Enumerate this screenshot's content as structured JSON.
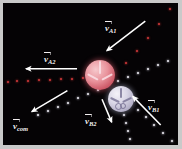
{
  "figure": {
    "kind": "physics-collision-diagram",
    "background_color": "#050305",
    "frame_color": "#c9c9c9",
    "width": 182,
    "height": 149
  },
  "labels": {
    "v_a1": {
      "symbol": "v",
      "subscript": "A1",
      "text": "v⃗A1",
      "x": 105,
      "y": 24
    },
    "v_a2": {
      "symbol": "v",
      "subscript": "A2",
      "text": "v⃗A2",
      "x": 44,
      "y": 55
    },
    "v_com": {
      "symbol": "v",
      "subscript": "com",
      "text": "v⃗com",
      "x": 13,
      "y": 122
    },
    "v_b2": {
      "symbol": "v",
      "subscript": "B2",
      "text": "v⃗B2",
      "x": 85,
      "y": 117
    },
    "v_b1": {
      "symbol": "v",
      "subscript": "B1",
      "text": "v⃗B1",
      "x": 148,
      "y": 103
    }
  },
  "balls": {
    "ball_a": {
      "name": "ball-A",
      "color": "#e0848f",
      "cx": 100,
      "cy": 75,
      "r": 15
    },
    "ball_b": {
      "name": "ball-B",
      "color": "#cdcadd",
      "cx": 121,
      "cy": 99,
      "r": 13
    }
  },
  "arrows": {
    "v_a1": {
      "x1": 151,
      "y1": 22,
      "x2": 111,
      "y2": 53,
      "color": "#ffffff"
    },
    "v_a2": {
      "x1": 80,
      "y1": 72,
      "x2": 27,
      "y2": 72,
      "color": "#ffffff"
    },
    "v_com": {
      "x1": 70,
      "y1": 95,
      "x2": 33,
      "y2": 117,
      "color": "#ffffff"
    },
    "v_b2": {
      "x1": 106,
      "y1": 104,
      "x2": 116,
      "y2": 128,
      "color": "#ffffff"
    },
    "v_b1": {
      "x1": 167,
      "y1": 131,
      "x2": 138,
      "y2": 101,
      "color": "#ffffff"
    }
  },
  "trajectories": {
    "a1_incoming": {
      "name": "ball-A-incoming-path",
      "color": "#d23a3a",
      "points": [
        [
          170,
          9
        ],
        [
          159,
          24
        ],
        [
          148,
          38
        ],
        [
          137,
          51
        ],
        [
          126,
          63
        ]
      ]
    },
    "a2_outgoing": {
      "name": "ball-A-outgoing-path",
      "color": "#d23a3a",
      "points": [
        [
          83,
          78
        ],
        [
          72,
          79
        ],
        [
          61,
          79
        ],
        [
          50,
          80
        ],
        [
          39,
          80
        ],
        [
          28,
          81
        ],
        [
          17,
          81
        ],
        [
          8,
          82
        ]
      ]
    },
    "b1_incoming": {
      "name": "ball-B-incoming-path",
      "color": "#efeef4",
      "points": [
        [
          172,
          141
        ],
        [
          163,
          133
        ],
        [
          154,
          125
        ],
        [
          146,
          117
        ],
        [
          138,
          110
        ]
      ]
    },
    "b2_outgoing": {
      "name": "ball-B-outgoing-path",
      "color": "#efeef4",
      "points": [
        [
          124,
          115
        ],
        [
          126,
          123
        ],
        [
          128,
          131
        ],
        [
          130,
          139
        ]
      ]
    },
    "com_path": {
      "name": "center-of-mass-path",
      "color": "#efeef4",
      "points": [
        [
          168,
          61
        ],
        [
          158,
          65
        ],
        [
          148,
          69
        ],
        [
          138,
          73
        ],
        [
          128,
          77
        ],
        [
          118,
          81
        ],
        [
          108,
          85
        ],
        [
          98,
          90
        ],
        [
          88,
          94
        ],
        [
          78,
          98
        ],
        [
          68,
          103
        ],
        [
          58,
          107
        ],
        [
          48,
          111
        ],
        [
          38,
          115
        ]
      ]
    }
  }
}
